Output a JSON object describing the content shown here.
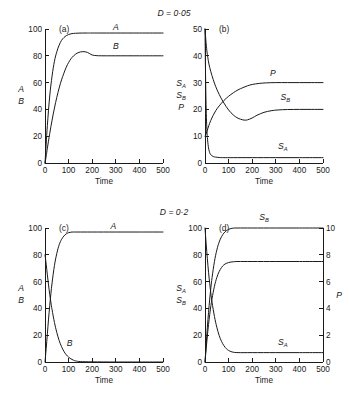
{
  "figure": {
    "background": "#ffffff",
    "stroke_color": "#1a1a1a",
    "conditions": [
      {
        "label": "D = 0·05",
        "value": 0.05
      },
      {
        "label": "D = 0·2",
        "value": 0.2
      }
    ]
  },
  "chart_data": [
    {
      "type": "line",
      "panel": "(a)",
      "title": "",
      "condition": "D = 0·05",
      "xlabel": "Time",
      "ylabel": "A\nB",
      "ylabel_parts": [
        "A",
        "B"
      ],
      "xlim": [
        0,
        500
      ],
      "ylim": [
        0,
        100
      ],
      "xticks": [
        0,
        100,
        200,
        300,
        400,
        500
      ],
      "yticks": [
        0,
        20,
        40,
        60,
        80,
        100
      ],
      "grid": false,
      "legend": "inline-curve-labels",
      "series": [
        {
          "name": "A",
          "label_x": 300,
          "label_y": 99,
          "x": [
            0,
            5,
            10,
            20,
            30,
            40,
            50,
            60,
            70,
            80,
            90,
            100,
            110,
            120,
            140,
            160,
            180,
            200,
            250,
            300,
            400,
            500
          ],
          "y": [
            0,
            14,
            28,
            50,
            65,
            76,
            83,
            88,
            91.5,
            93.6,
            95,
            95.9,
            96.4,
            96.7,
            96.9,
            97,
            97,
            97,
            97,
            97,
            97,
            97
          ]
        },
        {
          "name": "B",
          "label_x": 300,
          "label_y": 85,
          "x": [
            0,
            5,
            10,
            20,
            30,
            40,
            50,
            60,
            70,
            80,
            90,
            100,
            110,
            120,
            130,
            140,
            150,
            160,
            170,
            180,
            190,
            200,
            220,
            250,
            300,
            400,
            500
          ],
          "y": [
            0,
            5,
            11,
            22,
            32,
            41,
            49,
            56,
            62,
            67,
            71.5,
            75,
            77.8,
            79.8,
            81.3,
            82.3,
            82.9,
            83.1,
            83.0,
            82.5,
            81.6,
            80.6,
            80.1,
            80,
            80,
            80,
            80
          ]
        }
      ]
    },
    {
      "type": "line",
      "panel": "(b)",
      "title": "",
      "condition": "D = 0·05",
      "xlabel": "Time",
      "ylabel_parts": [
        "S_A",
        "S_B",
        "P"
      ],
      "xlim": [
        0,
        500
      ],
      "ylim": [
        0,
        50
      ],
      "xticks": [
        0,
        100,
        200,
        300,
        400,
        500
      ],
      "yticks": [
        0,
        10,
        20,
        30,
        40,
        50
      ],
      "grid": false,
      "series": [
        {
          "name": "S_A",
          "label": "S",
          "label_sub": "A",
          "label_x": 330,
          "label_y": 5.2,
          "x": [
            0,
            2,
            4,
            6,
            8,
            10,
            14,
            18,
            22,
            28,
            35,
            45,
            60,
            80,
            120,
            200,
            300,
            400,
            500
          ],
          "y": [
            50,
            35,
            24,
            17,
            12.5,
            9.5,
            6.2,
            4.4,
            3.4,
            2.8,
            2.4,
            2.2,
            2.05,
            2.0,
            2.0,
            2.0,
            2.0,
            2.0,
            2.0
          ]
        },
        {
          "name": "S_B",
          "label": "S",
          "label_sub": "B",
          "label_x": 340,
          "label_y": 23.5,
          "x": [
            0,
            3,
            6,
            10,
            20,
            40,
            60,
            80,
            100,
            120,
            140,
            160,
            170,
            180,
            200,
            220,
            250,
            280,
            310,
            350,
            400,
            450,
            500
          ],
          "y": [
            50,
            46.5,
            43.5,
            40.5,
            35.6,
            29.8,
            25.6,
            22.4,
            19.8,
            17.9,
            16.7,
            16.1,
            16.0,
            16.1,
            16.8,
            17.8,
            18.9,
            19.5,
            19.8,
            19.95,
            20,
            20,
            20
          ]
        },
        {
          "name": "P",
          "label": "P",
          "label_x": 288,
          "label_y": 32.5,
          "x": [
            0,
            3,
            6,
            10,
            16,
            24,
            34,
            46,
            60,
            80,
            100,
            120,
            140,
            160,
            180,
            200,
            230,
            260,
            300,
            350,
            400,
            450,
            500
          ],
          "y": [
            10,
            10.5,
            11.2,
            12.3,
            13.9,
            15.8,
            17.7,
            19.6,
            21.3,
            23.3,
            24.9,
            26.2,
            27.3,
            28.1,
            28.8,
            29.3,
            29.7,
            29.9,
            30,
            30,
            30,
            30,
            30
          ]
        }
      ]
    },
    {
      "type": "line",
      "panel": "(c)",
      "title": "",
      "condition": "D = 0·2",
      "xlabel": "Time",
      "ylabel_parts": [
        "A",
        "B"
      ],
      "xlim": [
        0,
        500
      ],
      "ylim": [
        0,
        100
      ],
      "xticks": [
        0,
        100,
        200,
        300,
        400,
        500
      ],
      "yticks": [
        0,
        20,
        40,
        60,
        80,
        100
      ],
      "grid": false,
      "series": [
        {
          "name": "A",
          "label_x": 290,
          "label_y": 99,
          "x": [
            0,
            5,
            10,
            15,
            20,
            25,
            30,
            40,
            50,
            60,
            70,
            80,
            90,
            100,
            110,
            120,
            140,
            200,
            300,
            400,
            500
          ],
          "y": [
            0,
            10,
            21,
            32,
            42,
            51,
            59,
            72,
            81,
            87.5,
            91.5,
            94,
            95.6,
            96.5,
            96.9,
            97,
            97,
            97,
            97,
            97,
            97
          ]
        },
        {
          "name": "B",
          "label_x": 104,
          "label_y": 12,
          "x": [
            0,
            5,
            10,
            15,
            20,
            25,
            30,
            40,
            50,
            60,
            70,
            80,
            90,
            100,
            110,
            120,
            130,
            150,
            200,
            300,
            400,
            500
          ],
          "y": [
            80,
            73,
            65,
            57.5,
            50.5,
            44.5,
            39,
            29.5,
            22,
            16,
            11.5,
            8,
            5.4,
            3.6,
            2.3,
            1.4,
            0.8,
            0.3,
            0.1,
            0,
            0,
            0
          ]
        }
      ]
    },
    {
      "type": "line",
      "panel": "(d)",
      "title": "",
      "condition": "D = 0·2",
      "xlabel": "Time",
      "ylabel_parts": [
        "S_A",
        "S_B"
      ],
      "ylabel_right": "P",
      "xlim": [
        0,
        500
      ],
      "ylim": [
        0,
        100
      ],
      "ylim_right": [
        0,
        10
      ],
      "xticks": [
        0,
        100,
        200,
        300,
        400,
        500
      ],
      "yticks": [
        0,
        20,
        40,
        60,
        80,
        100
      ],
      "yticks_right": [
        0,
        2,
        4,
        6,
        8,
        10
      ],
      "grid": false,
      "series": [
        {
          "name": "S_A",
          "label": "S",
          "label_sub": "A",
          "label_x": 330,
          "label_y": 13,
          "axis": "left",
          "x": [
            0,
            5,
            10,
            15,
            20,
            25,
            30,
            40,
            50,
            60,
            70,
            80,
            90,
            100,
            110,
            120,
            140,
            200,
            300,
            400,
            500
          ],
          "y": [
            100,
            88,
            77,
            67,
            58.5,
            51,
            44.5,
            34,
            26,
            19.8,
            15.4,
            12.2,
            10,
            8.6,
            7.8,
            7.3,
            7.0,
            7.0,
            7.0,
            7.0,
            7.0
          ]
        },
        {
          "name": "S_B",
          "label": "S",
          "label_sub": "B",
          "label_x": 250,
          "label_y": 106,
          "axis": "left",
          "x": [
            0,
            5,
            10,
            15,
            20,
            25,
            30,
            40,
            50,
            60,
            70,
            80,
            90,
            100,
            110,
            120,
            140,
            200,
            300,
            400,
            500
          ],
          "y": [
            0,
            13,
            26,
            37,
            47,
            55.5,
            63,
            75,
            83.5,
            89.5,
            93.5,
            96.2,
            97.9,
            99,
            99.6,
            99.9,
            100,
            100,
            100,
            100,
            100
          ]
        },
        {
          "name": "P",
          "label": "P",
          "label_x": 280,
          "label_y": 80,
          "axis": "right",
          "x": [
            0,
            5,
            10,
            15,
            20,
            25,
            30,
            40,
            50,
            60,
            70,
            80,
            90,
            100,
            110,
            120,
            140,
            200,
            300,
            400,
            500
          ],
          "y": [
            0,
            1.0,
            1.95,
            2.8,
            3.55,
            4.2,
            4.75,
            5.65,
            6.3,
            6.75,
            7.05,
            7.25,
            7.36,
            7.42,
            7.46,
            7.48,
            7.5,
            7.5,
            7.5,
            7.5,
            7.5
          ]
        }
      ]
    }
  ]
}
